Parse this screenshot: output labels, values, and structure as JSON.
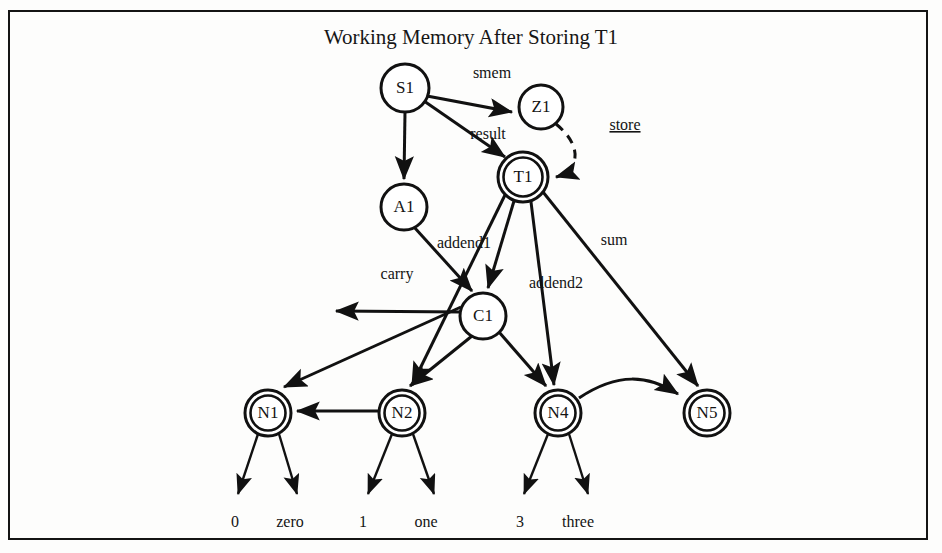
{
  "figure": {
    "title": "Working Memory After Storing T1",
    "border_color": "#141414",
    "ink_color": "#111111",
    "background": "#fdfdfc"
  },
  "nodes": [
    {
      "id": "S1",
      "label": "S1",
      "shape": "circle",
      "cx": 405,
      "cy": 88,
      "r": 24
    },
    {
      "id": "Z1",
      "label": "Z1",
      "shape": "circle",
      "cx": 541,
      "cy": 107,
      "r": 22
    },
    {
      "id": "T1",
      "label": "T1",
      "shape": "double-circle",
      "cx": 523,
      "cy": 177,
      "r": 25
    },
    {
      "id": "A1",
      "label": "A1",
      "shape": "circle",
      "cx": 404,
      "cy": 207,
      "r": 23
    },
    {
      "id": "C1",
      "label": "C1",
      "shape": "circle",
      "cx": 483,
      "cy": 316,
      "r": 23
    },
    {
      "id": "N1",
      "label": "N1",
      "shape": "double-circle",
      "cx": 268,
      "cy": 413,
      "r": 23
    },
    {
      "id": "N2",
      "label": "N2",
      "shape": "double-circle",
      "cx": 402,
      "cy": 413,
      "r": 23
    },
    {
      "id": "N4",
      "label": "N4",
      "shape": "double-circle",
      "cx": 558,
      "cy": 413,
      "r": 23
    },
    {
      "id": "N5",
      "label": "N5",
      "shape": "double-circle",
      "cx": 707,
      "cy": 413,
      "r": 23
    }
  ],
  "edges": [
    {
      "id": "s1-z1",
      "from": "S1",
      "to": "Z1",
      "label": "smem",
      "style": "solid",
      "label_x": 492,
      "label_y": 78
    },
    {
      "id": "s1-t1",
      "from": "S1",
      "to": "T1",
      "label": "result",
      "style": "solid",
      "label_x": 488,
      "label_y": 139
    },
    {
      "id": "s1-a1",
      "from": "S1",
      "to": "A1",
      "label": "",
      "style": "solid"
    },
    {
      "id": "z1-t1",
      "from": "Z1",
      "to": "T1",
      "label": "store",
      "style": "dashed",
      "label_x": 625,
      "label_y": 130,
      "underlined": true
    },
    {
      "id": "t1-c1",
      "from": "T1",
      "to": "C1",
      "label": "addend1",
      "style": "solid",
      "label_x": 464,
      "label_y": 248
    },
    {
      "id": "t1-n2",
      "from": "T1",
      "to": "N2",
      "label": "",
      "style": "solid"
    },
    {
      "id": "t1-n4",
      "from": "T1",
      "to": "N4",
      "label": "addend2",
      "style": "solid",
      "label_x": 556,
      "label_y": 288
    },
    {
      "id": "t1-n5",
      "from": "T1",
      "to": "N5",
      "label": "sum",
      "style": "solid",
      "label_x": 614,
      "label_y": 245
    },
    {
      "id": "a1-c1",
      "from": "A1",
      "to": "C1",
      "label": "",
      "style": "solid"
    },
    {
      "id": "c1-left",
      "from": "C1",
      "to": "free-left",
      "label": "carry",
      "style": "solid",
      "label_x": 397,
      "label_y": 279
    },
    {
      "id": "c1-n1",
      "from": "C1",
      "to": "N1",
      "label": "",
      "style": "solid"
    },
    {
      "id": "c1-n2",
      "from": "C1",
      "to": "N2",
      "label": "",
      "style": "solid"
    },
    {
      "id": "c1-n4",
      "from": "C1",
      "to": "N4",
      "label": "",
      "style": "solid"
    },
    {
      "id": "n2-n1",
      "from": "N2",
      "to": "N1",
      "label": "",
      "style": "solid"
    },
    {
      "id": "n4-n5",
      "from": "N4",
      "to": "N5",
      "label": "",
      "style": "curved"
    }
  ],
  "leaves": [
    {
      "id": "leaf-n1-0",
      "parent": "N1",
      "label": "0",
      "x": 235,
      "y": 527
    },
    {
      "id": "leaf-n1-zero",
      "parent": "N1",
      "label": "zero",
      "x": 290,
      "y": 527
    },
    {
      "id": "leaf-n2-1",
      "parent": "N2",
      "label": "1",
      "x": 363,
      "y": 527
    },
    {
      "id": "leaf-n2-one",
      "parent": "N2",
      "label": "one",
      "x": 426,
      "y": 527
    },
    {
      "id": "leaf-n4-3",
      "parent": "N4",
      "label": "3",
      "x": 520,
      "y": 527
    },
    {
      "id": "leaf-n4-three",
      "parent": "N4",
      "label": "three",
      "x": 578,
      "y": 527
    }
  ]
}
